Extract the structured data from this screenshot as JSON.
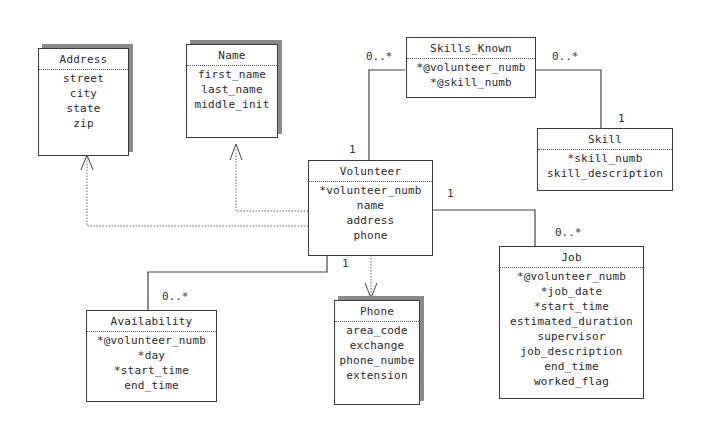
{
  "diagram": {
    "type": "UML class diagram",
    "classes": {
      "address": {
        "name": "Address",
        "attributes": [
          "street",
          "city",
          "state",
          "zip"
        ]
      },
      "name": {
        "name": "Name",
        "attributes": [
          "first_name",
          "last_name",
          "middle_init"
        ]
      },
      "skills_known": {
        "name": "Skills_Known",
        "attributes": [
          "*@volunteer_numb",
          "*@skill_numb"
        ]
      },
      "skill": {
        "name": "Skill",
        "attributes": [
          "*skill_numb",
          "skill_description"
        ]
      },
      "volunteer": {
        "name": "Volunteer",
        "attributes": [
          "*volunteer_numb",
          "name",
          "address",
          "phone"
        ]
      },
      "job": {
        "name": "Job",
        "attributes": [
          "*@volunteer_numb",
          "*job_date",
          "*start_time",
          "estimated_duration",
          "supervisor",
          "job_description",
          "end_time",
          "worked_flag"
        ]
      },
      "phone": {
        "name": "Phone",
        "attributes": [
          "area_code",
          "exchange",
          "phone_numbe",
          "extension"
        ]
      },
      "availability": {
        "name": "Availability",
        "attributes": [
          "*@volunteer_numb",
          "*day",
          "*start_time",
          "end_time"
        ]
      }
    },
    "multiplicities": {
      "volunteer_skills_known_many": "0..*",
      "volunteer_skills_known_one": "1",
      "skill_skills_known_many": "0..*",
      "skill_skills_known_one": "1",
      "volunteer_job_one": "1",
      "volunteer_job_many": "0..*",
      "volunteer_availability_one": "1",
      "volunteer_availability_many": "0..*"
    },
    "relationships": [
      {
        "from": "Volunteer",
        "to": "Skills_Known",
        "kind": "association",
        "from_mult": "1",
        "to_mult": "0..*"
      },
      {
        "from": "Skill",
        "to": "Skills_Known",
        "kind": "association",
        "from_mult": "1",
        "to_mult": "0..*"
      },
      {
        "from": "Volunteer",
        "to": "Job",
        "kind": "association",
        "from_mult": "1",
        "to_mult": "0..*"
      },
      {
        "from": "Volunteer",
        "to": "Availability",
        "kind": "association",
        "from_mult": "1",
        "to_mult": "0..*"
      },
      {
        "from": "Volunteer",
        "to": "Address",
        "kind": "dependency"
      },
      {
        "from": "Volunteer",
        "to": "Name",
        "kind": "dependency"
      },
      {
        "from": "Volunteer",
        "to": "Phone",
        "kind": "dependency"
      }
    ]
  }
}
